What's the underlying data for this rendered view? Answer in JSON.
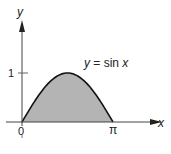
{
  "chart_data": {
    "type": "area",
    "title": "",
    "function_label": "y = sin x",
    "xlabel": "x",
    "ylabel": "y",
    "x_ticks": [
      {
        "value": 0,
        "label": "0"
      },
      {
        "value": 3.14159,
        "label": "π"
      }
    ],
    "y_ticks": [
      {
        "value": 1,
        "label": "1"
      }
    ],
    "x": [
      0,
      0.3927,
      0.7854,
      1.1781,
      1.5708,
      1.9635,
      2.3562,
      2.7489,
      3.1416
    ],
    "series": [
      {
        "name": "sin x",
        "values": [
          0,
          0.383,
          0.707,
          0.924,
          1,
          0.924,
          0.707,
          0.383,
          0
        ]
      }
    ],
    "xlim": [
      0,
      3.1416
    ],
    "ylim": [
      0,
      1
    ],
    "fill_color": "#b4b4b4",
    "line_color": "#111111",
    "grid": false,
    "legend": "none"
  },
  "labels": {
    "y_axis": "y",
    "x_axis": "x",
    "origin": "0",
    "pi": "π",
    "one": "1",
    "eq_y": "y",
    "eq_mid": " = sin ",
    "eq_x": "x"
  }
}
